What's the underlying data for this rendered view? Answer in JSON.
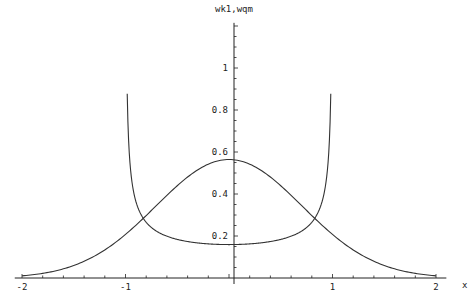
{
  "chart_data": {
    "type": "line",
    "title": "wk1,wqm",
    "xlabel": "x",
    "ylabel": "wk1,wqm",
    "xlim": [
      -2,
      2
    ],
    "ylim": [
      0,
      1.22
    ],
    "x_ticks": [
      -2,
      -1,
      1,
      2
    ],
    "y_ticks": [
      0.2,
      0.4,
      0.6,
      0.8,
      1
    ],
    "x_tick_labels": [
      "-2",
      "-1",
      "1",
      "2"
    ],
    "y_tick_labels": [
      "0.2",
      "0.4",
      "0.6",
      "0.8",
      "1"
    ],
    "grid": false,
    "legend": null,
    "series": [
      {
        "name": "wk1",
        "description": "bell curve, peak ~0.564 at x=0",
        "x": [
          -2,
          -1.5,
          -1,
          -0.5,
          0,
          0.5,
          1,
          1.5,
          2
        ],
        "values": [
          0.01,
          0.06,
          0.21,
          0.44,
          0.564,
          0.44,
          0.21,
          0.06,
          0.01
        ]
      },
      {
        "name": "wqm",
        "description": "U-shaped curve, min ~0.16 at x=0, diverging near x=±1",
        "x": [
          -0.97,
          -0.9,
          -0.8,
          -0.6,
          -0.4,
          -0.2,
          0,
          0.2,
          0.4,
          0.6,
          0.8,
          0.9,
          0.97
        ],
        "values": [
          1.22,
          0.37,
          0.27,
          0.2,
          0.17,
          0.16,
          0.159,
          0.16,
          0.17,
          0.2,
          0.27,
          0.37,
          1.22
        ]
      }
    ]
  }
}
